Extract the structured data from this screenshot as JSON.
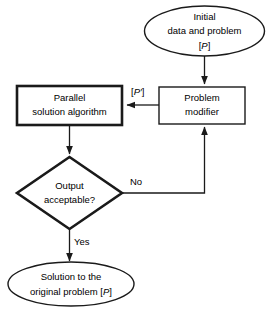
{
  "diagram": {
    "background_color": "#ffffff",
    "stroke_color": "#1a1a1a",
    "text_color": "#000000"
  },
  "nodes": {
    "initial_data": {
      "shape": "ellipse",
      "line1": "Initial",
      "line2": "data and problem",
      "line3_bracket_open": "[",
      "line3_symbol": "P",
      "line3_bracket_close": "]"
    },
    "problem_modifier": {
      "shape": "rectangle",
      "line1": "Problem",
      "line2": "modifier"
    },
    "parallel_algorithm": {
      "shape": "rectangle",
      "line1": "Parallel",
      "line2": "solution algorithm"
    },
    "output_decision": {
      "shape": "diamond",
      "line1": "Output",
      "line2": "acceptable?"
    },
    "solution": {
      "shape": "ellipse",
      "line1": "Solution to the",
      "line2_prefix": "original problem [",
      "line2_symbol": "P",
      "line2_suffix": "]"
    }
  },
  "edges": {
    "modified_problem_label": {
      "bracket_open": "[",
      "symbol": "P",
      "prime": "′",
      "bracket_close": "]"
    },
    "no_label": "No",
    "yes_label": "Yes"
  }
}
